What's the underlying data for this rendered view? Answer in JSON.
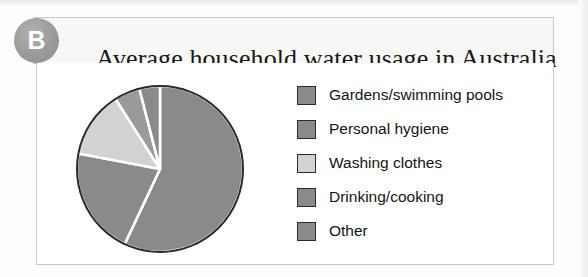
{
  "figure": {
    "badge_letter": "B",
    "title": "Average household water usage in Australia"
  },
  "legend": {
    "items": [
      {
        "label": "Gardens/swimming pools",
        "color": "#8a8a8a"
      },
      {
        "label": "Personal hygiene",
        "color": "#8a8a8a"
      },
      {
        "label": "Washing clothes",
        "color": "#d2d2d2"
      },
      {
        "label": "Drinking/cooking",
        "color": "#8a8a8a"
      },
      {
        "label": "Other",
        "color": "#8a8a8a"
      }
    ]
  },
  "chart_data": {
    "type": "pie",
    "title": "Average household water usage in Australia",
    "categories": [
      "Gardens/swimming pools",
      "Personal hygiene",
      "Washing clothes",
      "Drinking/cooking",
      "Other"
    ],
    "values": [
      57,
      21,
      13,
      5,
      4
    ],
    "unit": "percent",
    "start_angle_deg": 0,
    "direction": "clockwise",
    "colors": [
      "#8a8a8a",
      "#8a8a8a",
      "#d2d2d2",
      "#9a9a9a",
      "#8a8a8a"
    ],
    "slice_separator_color": "#ffffff",
    "outline_color": "#2a2a2a",
    "legend_position": "right",
    "data_labels": false,
    "grid": false
  }
}
